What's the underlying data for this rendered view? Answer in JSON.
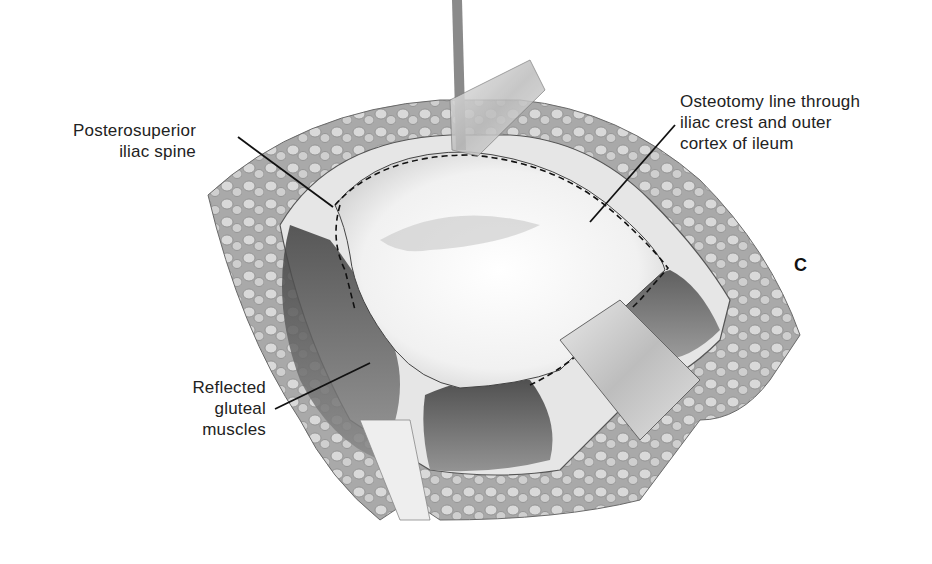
{
  "figure": {
    "panel_letter": "C",
    "labels": {
      "posterosuperior": {
        "line1": "Posterosuperior",
        "line2": "iliac spine"
      },
      "osteotomy": {
        "line1": "Osteotomy line through",
        "line2": "iliac crest and outer",
        "line3": "cortex of ileum"
      },
      "gluteal": {
        "line1": "Reflected",
        "line2": "gluteal",
        "line3": "muscles"
      }
    },
    "colors": {
      "ink": "#1a1a1a",
      "tissue_dark": "#555555",
      "tissue_mid": "#9a9a9a",
      "fat_light": "#d8d8d8",
      "bone": "#f4f4f4"
    }
  }
}
